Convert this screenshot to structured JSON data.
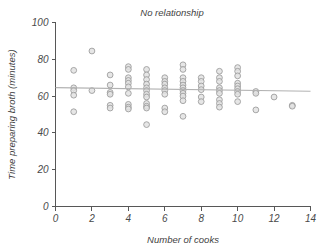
{
  "chart_data": {
    "type": "scatter",
    "title": "No relationship",
    "xlabel": "Number of cooks",
    "ylabel": "Time preparing broth (minutes)",
    "xlim": [
      0,
      14
    ],
    "ylim": [
      0,
      100
    ],
    "xticks": [
      0,
      2,
      4,
      6,
      8,
      10,
      12,
      14
    ],
    "yticks": [
      0,
      20,
      40,
      60,
      80,
      100
    ],
    "xtick_labels": [
      "0",
      "2",
      "4",
      "6",
      "8",
      "10",
      "12",
      "14"
    ],
    "ytick_labels": [
      "0",
      "20",
      "40",
      "60",
      "80",
      "100"
    ],
    "grid": false,
    "legend": "none",
    "marker_style": "open-circle",
    "marker_fill_color": "#e2e2e2",
    "marker_edge_color": "#9a9a9a",
    "trend_line": {
      "label": "regression-line",
      "color": "#b2b2b2",
      "x": [
        0.0,
        14.0
      ],
      "y": [
        64.6,
        62.6
      ],
      "slope": -0.143,
      "intercept": 64.6
    },
    "points": [
      {
        "x": 1,
        "y": 74.0
      },
      {
        "x": 1,
        "y": 64.5
      },
      {
        "x": 1,
        "y": 63.0
      },
      {
        "x": 1,
        "y": 60.5
      },
      {
        "x": 1,
        "y": 51.5
      },
      {
        "x": 2,
        "y": 84.5
      },
      {
        "x": 2,
        "y": 63.0
      },
      {
        "x": 3,
        "y": 71.5
      },
      {
        "x": 3,
        "y": 66.0
      },
      {
        "x": 3,
        "y": 62.0
      },
      {
        "x": 3,
        "y": 61.0
      },
      {
        "x": 3,
        "y": 55.0
      },
      {
        "x": 3,
        "y": 53.5
      },
      {
        "x": 4,
        "y": 76.0
      },
      {
        "x": 4,
        "y": 74.5
      },
      {
        "x": 4,
        "y": 70.0
      },
      {
        "x": 4,
        "y": 68.5
      },
      {
        "x": 4,
        "y": 67.0
      },
      {
        "x": 4,
        "y": 65.0
      },
      {
        "x": 4,
        "y": 61.5
      },
      {
        "x": 4,
        "y": 55.5
      },
      {
        "x": 4,
        "y": 54.0
      },
      {
        "x": 4,
        "y": 53.0
      },
      {
        "x": 5,
        "y": 74.5
      },
      {
        "x": 5,
        "y": 71.5
      },
      {
        "x": 5,
        "y": 69.0
      },
      {
        "x": 5,
        "y": 66.5
      },
      {
        "x": 5,
        "y": 64.5
      },
      {
        "x": 5,
        "y": 63.0
      },
      {
        "x": 5,
        "y": 61.0
      },
      {
        "x": 5,
        "y": 59.5
      },
      {
        "x": 5,
        "y": 56.0
      },
      {
        "x": 5,
        "y": 54.5
      },
      {
        "x": 5,
        "y": 53.5
      },
      {
        "x": 5,
        "y": 44.5
      },
      {
        "x": 6,
        "y": 70.0
      },
      {
        "x": 6,
        "y": 68.0
      },
      {
        "x": 6,
        "y": 66.5
      },
      {
        "x": 6,
        "y": 64.5
      },
      {
        "x": 6,
        "y": 63.0
      },
      {
        "x": 6,
        "y": 61.0
      },
      {
        "x": 6,
        "y": 53.5
      },
      {
        "x": 6,
        "y": 51.5
      },
      {
        "x": 7,
        "y": 77.0
      },
      {
        "x": 7,
        "y": 74.5
      },
      {
        "x": 7,
        "y": 70.0
      },
      {
        "x": 7,
        "y": 68.0
      },
      {
        "x": 7,
        "y": 66.0
      },
      {
        "x": 7,
        "y": 64.5
      },
      {
        "x": 7,
        "y": 63.0
      },
      {
        "x": 7,
        "y": 61.5
      },
      {
        "x": 7,
        "y": 60.0
      },
      {
        "x": 7,
        "y": 57.5
      },
      {
        "x": 7,
        "y": 49.0
      },
      {
        "x": 8,
        "y": 70.0
      },
      {
        "x": 8,
        "y": 68.0
      },
      {
        "x": 8,
        "y": 65.5
      },
      {
        "x": 8,
        "y": 63.5
      },
      {
        "x": 8,
        "y": 59.5
      },
      {
        "x": 8,
        "y": 57.0
      },
      {
        "x": 9,
        "y": 73.5
      },
      {
        "x": 9,
        "y": 70.0
      },
      {
        "x": 9,
        "y": 68.0
      },
      {
        "x": 9,
        "y": 64.5
      },
      {
        "x": 9,
        "y": 63.0
      },
      {
        "x": 9,
        "y": 61.5
      },
      {
        "x": 9,
        "y": 58.0
      },
      {
        "x": 9,
        "y": 56.0
      },
      {
        "x": 9,
        "y": 54.0
      },
      {
        "x": 10,
        "y": 75.5
      },
      {
        "x": 10,
        "y": 73.5
      },
      {
        "x": 10,
        "y": 71.0
      },
      {
        "x": 10,
        "y": 67.0
      },
      {
        "x": 10,
        "y": 65.5
      },
      {
        "x": 10,
        "y": 64.0
      },
      {
        "x": 10,
        "y": 62.5
      },
      {
        "x": 10,
        "y": 61.0
      },
      {
        "x": 10,
        "y": 57.0
      },
      {
        "x": 11,
        "y": 62.5
      },
      {
        "x": 11,
        "y": 61.5
      },
      {
        "x": 11,
        "y": 52.5
      },
      {
        "x": 12,
        "y": 59.5
      },
      {
        "x": 13,
        "y": 55.0
      },
      {
        "x": 13,
        "y": 54.5
      }
    ]
  }
}
